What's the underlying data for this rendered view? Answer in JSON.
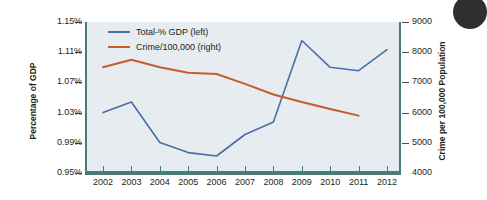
{
  "chart_data": {
    "type": "line",
    "title": "",
    "subtitle": "",
    "xlabel": "",
    "ylabel": "Percentage of GDP",
    "y2label": "Crime per 100,000 Population",
    "grid": false,
    "legend_position": "top-left",
    "categories": [
      "2002",
      "2003",
      "2004",
      "2005",
      "2006",
      "2007",
      "2008",
      "2009",
      "2010",
      "2011",
      "2012"
    ],
    "x": [
      2002,
      2003,
      2004,
      2005,
      2006,
      2007,
      2008,
      2009,
      2010,
      2011,
      2012
    ],
    "ylim": [
      0.95,
      1.15
    ],
    "yticks": [
      "0.95%",
      "0.99%",
      "1.03%",
      "1.07%",
      "1.11%",
      "1.15%"
    ],
    "ytick_values": [
      0.95,
      0.99,
      1.03,
      1.07,
      1.11,
      1.15
    ],
    "y2lim": [
      4000,
      9000
    ],
    "y2ticks": [
      "4000",
      "5000",
      "6000",
      "7000",
      "8000",
      "9000"
    ],
    "y2tick_values": [
      4000,
      5000,
      6000,
      7000,
      8000,
      9000
    ],
    "series": [
      {
        "name": "Total-% GDP (left)",
        "axis": "left",
        "color": "#4a6fa5",
        "values": [
          1.03,
          1.044,
          0.9905,
          0.977,
          0.9725,
          1.001,
          1.0175,
          1.1255,
          1.09,
          1.0855,
          1.1135
        ]
      },
      {
        "name": "Crime/100,000 (right)",
        "axis": "right",
        "color": "#c65b2e",
        "values": [
          7500,
          7750,
          7500,
          7320,
          7280,
          6950,
          6600,
          6350,
          6120,
          5900,
          null
        ]
      }
    ],
    "legend": [
      {
        "label": "Total-% GDP (left)",
        "color": "#4a6fa5"
      },
      {
        "label": "Crime/100,000 (right)",
        "color": "#c65b2e"
      }
    ],
    "colors": {
      "plot_background": "#e6ecef",
      "axis": "#4a7a78",
      "series_blue": "#4a6fa5",
      "series_orange": "#c65b2e",
      "text": "#231f20",
      "page_background": "#ffffff"
    }
  }
}
